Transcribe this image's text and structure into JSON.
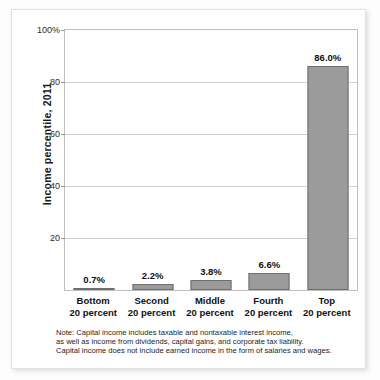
{
  "chart_data": {
    "type": "bar",
    "title": "",
    "subtitle": "",
    "xlabel": "",
    "ylabel": "Income percentile, 2011",
    "categories": [
      "Bottom 20 percent",
      "Second 20 percent",
      "Middle 20 percent",
      "Fourth 20 percent",
      "Top 20 percent"
    ],
    "category_lines": [
      {
        "line1": "Bottom",
        "line2": "20 percent"
      },
      {
        "line1": "Second",
        "line2": "20 percent"
      },
      {
        "line1": "Middle",
        "line2": "20 percent"
      },
      {
        "line1": "Fourth",
        "line2": "20 percent"
      },
      {
        "line1": "Top",
        "line2": "20 percent"
      }
    ],
    "values": [
      0.7,
      2.2,
      3.8,
      6.6,
      86.0
    ],
    "data_labels": [
      "0.7%",
      "2.2%",
      "3.8%",
      "6.6%",
      "86.0%"
    ],
    "ylim": [
      0,
      100
    ],
    "yticks": [
      20,
      40,
      60,
      80,
      100
    ],
    "ytick_labels": [
      "20",
      "40",
      "60",
      "80",
      "100%"
    ],
    "grid": true,
    "legend": "none",
    "bar_color": "#9b9b9b",
    "bar_edge_color": "#6f6f6f",
    "gridline_color": "#cfcfcf",
    "frame_color": "#bfbfbf",
    "annotations": [
      "Note: Capital income includes taxable and nontaxable interest income,",
      "as well as income from dividends, capital gains, and corporate tax liability.",
      "Capital income does not include earned income in the form of salaries and wages."
    ]
  },
  "note": {
    "line1": "Note: Capital income includes taxable and nontaxable interest income,",
    "line2": "as well as income from dividends, capital gains, and corporate tax liability.",
    "line3": "Capital income does not include earned income in the form of salaries and wages."
  }
}
